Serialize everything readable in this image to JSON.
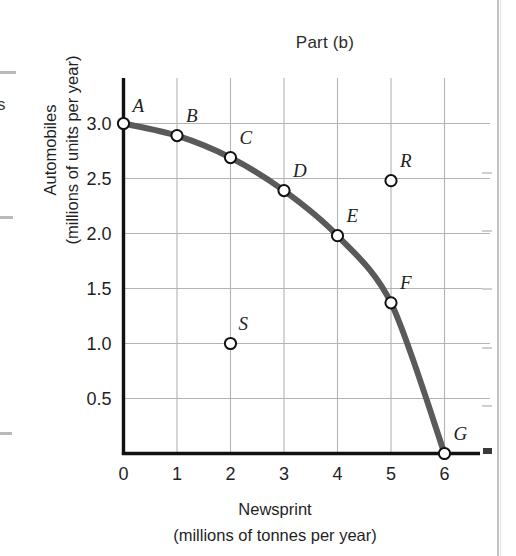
{
  "chart_data": {
    "type": "line",
    "title": "Part (b)",
    "xlabel": "Newsprint",
    "xlabel_sub": "(millions of tonnes per year)",
    "ylabel": "Automobiles",
    "ylabel_sub": "(millions of units per year)",
    "xlim": [
      0,
      6.6
    ],
    "ylim": [
      0,
      3.25
    ],
    "xticks": [
      "0",
      "1",
      "2",
      "3",
      "4",
      "5",
      "6"
    ],
    "xtick_values": [
      0,
      1,
      2,
      3,
      4,
      5,
      6
    ],
    "yticks": [
      "0.5",
      "1.0",
      "1.5",
      "2.0",
      "2.5",
      "3.0"
    ],
    "ytick_values": [
      0.5,
      1.0,
      1.5,
      2.0,
      2.5,
      3.0
    ],
    "grid": true,
    "legend": "none",
    "series": [
      {
        "name": "Production possibilities frontier",
        "color": "#5a5a5a",
        "points": [
          {
            "label": "A",
            "x": 0,
            "y": 3.0,
            "label_dx": 9,
            "label_dy": -12
          },
          {
            "label": "B",
            "x": 1,
            "y": 2.89,
            "label_dx": 9,
            "label_dy": -14
          },
          {
            "label": "C",
            "x": 2,
            "y": 2.69,
            "label_dx": 9,
            "label_dy": -14
          },
          {
            "label": "D",
            "x": 3,
            "y": 2.39,
            "label_dx": 9,
            "label_dy": -14
          },
          {
            "label": "E",
            "x": 4,
            "y": 1.98,
            "label_dx": 9,
            "label_dy": -14
          },
          {
            "label": "F",
            "x": 5,
            "y": 1.37,
            "label_dx": 9,
            "label_dy": -14
          },
          {
            "label": "G",
            "x": 6,
            "y": 0.0,
            "label_dx": 9,
            "label_dy": -14
          }
        ]
      }
    ],
    "extra_points": [
      {
        "label": "R",
        "x": 5,
        "y": 2.48,
        "label_dx": 9,
        "label_dy": -14,
        "note": "unattainable-point"
      },
      {
        "label": "S",
        "x": 2,
        "y": 1.0,
        "label_dx": 8,
        "label_dy": -14,
        "note": "inefficient-point"
      }
    ],
    "colors": {
      "curve": "#5a5a5a",
      "axis": "#111111",
      "grid": "#b3b3b3",
      "marker_fill": "#ffffff",
      "marker_stroke": "#111111",
      "text": "#1f1f1f",
      "page_edge": "#c2c2c2"
    }
  },
  "artifacts": {
    "left_fragment_letter": "s"
  }
}
